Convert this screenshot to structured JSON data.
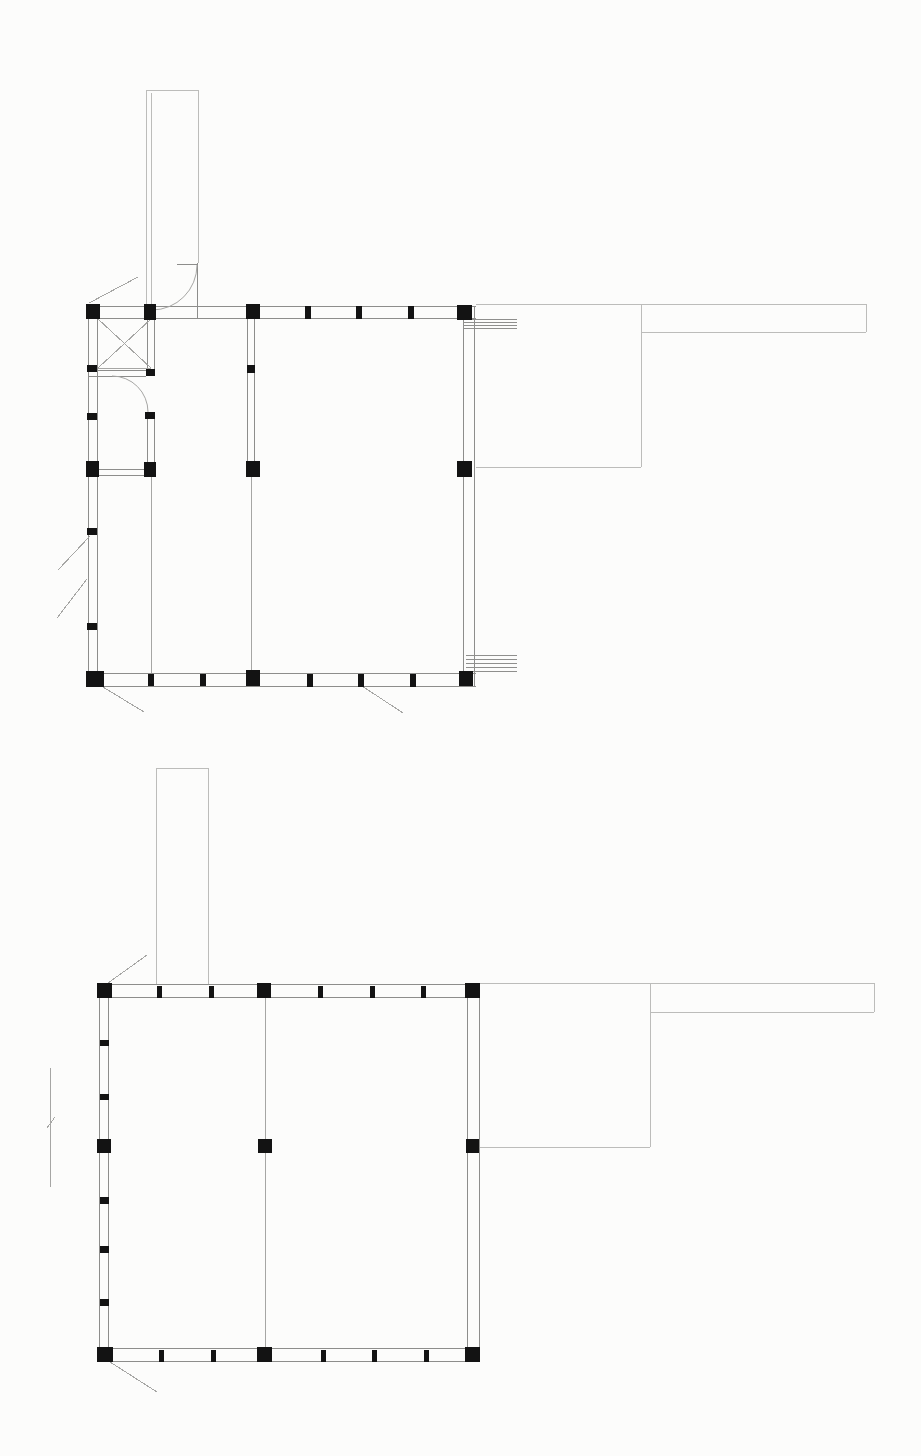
{
  "document": {
    "type": "architectural-drawing",
    "description": "Two stacked floor plans (upper plan with interior partitions, lower foundation/ground plan), each with right-side deck and long walkway",
    "canvas": {
      "width": 921,
      "height": 1456,
      "background": "#fcfcfb"
    }
  },
  "colors": {
    "wall": "#8d8d8b",
    "outline": "#bcbcba",
    "thin": "#a6a6a4",
    "stair": "#8f8f8d",
    "column": "#131313"
  },
  "plans": [
    {
      "id": "upper-floor-plan",
      "lines": [
        [
          86,
          306,
          476,
          306,
          "wall",
          "top-wall-outer-line"
        ],
        [
          86,
          318,
          476,
          318,
          "wall",
          "top-wall-inner-line"
        ],
        [
          86,
          673,
          476,
          673,
          "wall",
          "bottom-wall-inner-line"
        ],
        [
          86,
          686,
          476,
          686,
          "wall",
          "bottom-wall-outer-line"
        ],
        [
          88,
          306,
          88,
          686,
          "wall",
          "left-wall-outer-line"
        ],
        [
          97,
          306,
          97,
          686,
          "wall",
          "left-wall-inner-line"
        ],
        [
          463,
          318,
          463,
          673,
          "wall",
          "right-wall-inner-line"
        ],
        [
          474,
          306,
          474,
          686,
          "wall",
          "right-wall-outer-line"
        ],
        [
          147,
          318,
          147,
          375,
          "wall",
          "partition-wall-line"
        ],
        [
          154,
          318,
          154,
          375,
          "wall",
          "partition-wall-line"
        ],
        [
          147,
          413,
          147,
          463,
          "wall",
          "partition-wall-line"
        ],
        [
          154,
          413,
          154,
          463,
          "wall",
          "partition-wall-line"
        ],
        [
          97,
          469,
          147,
          469,
          "wall",
          "partition-wall-line"
        ],
        [
          97,
          475,
          147,
          475,
          "wall",
          "partition-wall-line"
        ],
        [
          88,
          370,
          146,
          370,
          "wall",
          "partition-wall-line"
        ],
        [
          88,
          376,
          146,
          376,
          "wall",
          "partition-wall-line"
        ],
        [
          247,
          318,
          247,
          461,
          "wall",
          "partition-wall-line"
        ],
        [
          254,
          318,
          254,
          461,
          "wall",
          "partition-wall-line"
        ],
        [
          151,
          477,
          151,
          673,
          "thin",
          "beam-line"
        ],
        [
          251,
          477,
          251,
          671,
          "thin",
          "beam-line"
        ],
        [
          98,
          319,
          151,
          368,
          "thin",
          "cross-brace-diagonal"
        ],
        [
          151,
          319,
          98,
          368,
          "thin",
          "cross-brace-diagonal"
        ],
        [
          98,
          368,
          151,
          368,
          "thin",
          "cross-brace-edge"
        ],
        [
          146,
          90,
          198,
          90,
          "outline",
          "chimney-outline"
        ],
        [
          146,
          90,
          146,
          310,
          "outline",
          "chimney-outline"
        ],
        [
          151,
          93,
          151,
          310,
          "outline",
          "chimney-outline"
        ],
        [
          198,
          90,
          198,
          263,
          "outline",
          "chimney-outline"
        ],
        [
          197,
          263,
          197,
          318,
          "wall",
          "door-jamb-line"
        ],
        [
          177,
          264,
          197,
          264,
          "wall",
          "door-head-line"
        ],
        [
          476,
          304,
          866,
          304,
          "outline",
          "deck-outline"
        ],
        [
          641,
          304,
          641,
          467,
          "outline",
          "deck-outline"
        ],
        [
          476,
          467,
          641,
          467,
          "outline",
          "deck-outline"
        ],
        [
          641,
          332,
          866,
          332,
          "outline",
          "walkway-outline"
        ],
        [
          866,
          304,
          866,
          332,
          "outline",
          "walkway-outline"
        ],
        [
          463,
          319,
          517,
          319,
          "stair",
          "stair-tread-line"
        ],
        [
          463,
          322,
          517,
          322,
          "stair",
          "stair-tread-line"
        ],
        [
          463,
          325,
          517,
          325,
          "stair",
          "stair-tread-line"
        ],
        [
          463,
          328,
          517,
          328,
          "stair",
          "stair-tread-line"
        ],
        [
          466,
          655,
          517,
          655,
          "stair",
          "stair-tread-line"
        ],
        [
          466,
          659,
          517,
          659,
          "stair",
          "stair-tread-line"
        ],
        [
          466,
          663,
          517,
          663,
          "stair",
          "stair-tread-line"
        ],
        [
          466,
          667,
          517,
          667,
          "stair",
          "stair-tread-line"
        ],
        [
          466,
          671,
          517,
          671,
          "stair",
          "stair-tread-line"
        ],
        [
          89,
          303,
          138,
          277,
          "thin",
          "railing-diagonal"
        ],
        [
          90,
          536,
          58,
          570,
          "thin",
          "railing-diagonal"
        ],
        [
          87,
          579,
          57,
          618,
          "thin",
          "railing-diagonal"
        ],
        [
          103,
          687,
          144,
          712,
          "thin",
          "railing-diagonal"
        ],
        [
          362,
          686,
          403,
          713,
          "thin",
          "door-leaf-line"
        ]
      ],
      "arcs": [
        [
          152,
          310,
          197,
          265,
          45,
          0,
          "door-swing-arc"
        ],
        [
          112,
          376,
          148,
          412,
          36,
          1,
          "door-swing-arc"
        ]
      ],
      "columns": [
        [
          86,
          304,
          14,
          15,
          "column"
        ],
        [
          144,
          304,
          12,
          16,
          "column"
        ],
        [
          246,
          304,
          14,
          15,
          "column"
        ],
        [
          457,
          305,
          15,
          15,
          "column"
        ],
        [
          86,
          461,
          13,
          16,
          "column"
        ],
        [
          144,
          462,
          12,
          15,
          "column"
        ],
        [
          246,
          461,
          14,
          16,
          "column"
        ],
        [
          457,
          461,
          15,
          16,
          "column"
        ],
        [
          86,
          671,
          18,
          16,
          "column"
        ],
        [
          246,
          670,
          14,
          16,
          "column"
        ],
        [
          459,
          671,
          14,
          15,
          "column"
        ],
        [
          305,
          306,
          6,
          13,
          "pier-tick"
        ],
        [
          356,
          306,
          6,
          13,
          "pier-tick"
        ],
        [
          408,
          306,
          6,
          13,
          "pier-tick"
        ],
        [
          87,
          365,
          10,
          7,
          "pier-tick"
        ],
        [
          87,
          413,
          10,
          7,
          "pier-tick"
        ],
        [
          87,
          528,
          10,
          7,
          "pier-tick"
        ],
        [
          87,
          623,
          10,
          7,
          "pier-tick"
        ],
        [
          146,
          369,
          9,
          7,
          "pier-tick"
        ],
        [
          145,
          412,
          10,
          7,
          "pier-tick"
        ],
        [
          247,
          365,
          8,
          8,
          "pier-tick"
        ],
        [
          148,
          674,
          6,
          12,
          "pier-tick"
        ],
        [
          200,
          674,
          6,
          12,
          "pier-tick"
        ],
        [
          307,
          674,
          6,
          13,
          "pier-tick"
        ],
        [
          358,
          674,
          6,
          13,
          "pier-tick"
        ],
        [
          410,
          674,
          6,
          13,
          "pier-tick"
        ]
      ]
    },
    {
      "id": "lower-floor-plan",
      "lines": [
        [
          97,
          984,
          480,
          984,
          "wall",
          "top-wall-outer-line"
        ],
        [
          97,
          997,
          480,
          997,
          "wall",
          "top-wall-inner-line"
        ],
        [
          97,
          1348,
          480,
          1348,
          "wall",
          "bottom-wall-inner-line"
        ],
        [
          97,
          1361,
          480,
          1361,
          "wall",
          "bottom-wall-outer-line"
        ],
        [
          99,
          984,
          99,
          1361,
          "wall",
          "left-wall-outer-line"
        ],
        [
          108,
          984,
          108,
          1361,
          "wall",
          "left-wall-inner-line"
        ],
        [
          467,
          997,
          467,
          1348,
          "wall",
          "right-wall-inner-line"
        ],
        [
          479,
          984,
          479,
          1361,
          "wall",
          "right-wall-outer-line"
        ],
        [
          265,
          997,
          265,
          1348,
          "thin",
          "beam-line"
        ],
        [
          156,
          768,
          208,
          768,
          "outline",
          "chimney-outline"
        ],
        [
          156,
          768,
          156,
          984,
          "outline",
          "chimney-outline"
        ],
        [
          208,
          768,
          208,
          984,
          "outline",
          "chimney-outline"
        ],
        [
          480,
          983,
          874,
          983,
          "outline",
          "deck-outline"
        ],
        [
          650,
          983,
          650,
          1147,
          "outline",
          "deck-outline"
        ],
        [
          480,
          1147,
          650,
          1147,
          "outline",
          "deck-outline"
        ],
        [
          650,
          1012,
          874,
          1012,
          "outline",
          "walkway-outline"
        ],
        [
          874,
          983,
          874,
          1012,
          "outline",
          "walkway-outline"
        ],
        [
          108,
          983,
          147,
          955,
          "thin",
          "railing-diagonal"
        ],
        [
          110,
          1362,
          157,
          1392,
          "thin",
          "railing-diagonal"
        ],
        [
          50,
          1068,
          50,
          1187,
          "thin",
          "site-line"
        ],
        [
          47,
          1128,
          55,
          1117,
          "thin",
          "site-tick"
        ]
      ],
      "arcs": [],
      "columns": [
        [
          97,
          983,
          15,
          15,
          "column"
        ],
        [
          257,
          983,
          14,
          15,
          "column"
        ],
        [
          465,
          983,
          15,
          15,
          "column"
        ],
        [
          97,
          1139,
          14,
          14,
          "column"
        ],
        [
          258,
          1139,
          14,
          14,
          "column"
        ],
        [
          466,
          1139,
          13,
          14,
          "column"
        ],
        [
          97,
          1347,
          16,
          15,
          "column"
        ],
        [
          257,
          1347,
          15,
          15,
          "column"
        ],
        [
          465,
          1347,
          15,
          15,
          "column"
        ],
        [
          157,
          986,
          5,
          12,
          "pier-tick"
        ],
        [
          209,
          986,
          5,
          12,
          "pier-tick"
        ],
        [
          318,
          986,
          5,
          12,
          "pier-tick"
        ],
        [
          370,
          986,
          5,
          12,
          "pier-tick"
        ],
        [
          421,
          986,
          5,
          12,
          "pier-tick"
        ],
        [
          100,
          1040,
          9,
          6,
          "pier-tick"
        ],
        [
          100,
          1094,
          9,
          6,
          "pier-tick"
        ],
        [
          100,
          1197,
          9,
          7,
          "pier-tick"
        ],
        [
          100,
          1246,
          9,
          7,
          "pier-tick"
        ],
        [
          100,
          1299,
          9,
          7,
          "pier-tick"
        ],
        [
          159,
          1350,
          5,
          12,
          "pier-tick"
        ],
        [
          211,
          1350,
          5,
          12,
          "pier-tick"
        ],
        [
          321,
          1350,
          5,
          12,
          "pier-tick"
        ],
        [
          372,
          1350,
          5,
          12,
          "pier-tick"
        ],
        [
          424,
          1350,
          5,
          12,
          "pier-tick"
        ]
      ]
    }
  ]
}
